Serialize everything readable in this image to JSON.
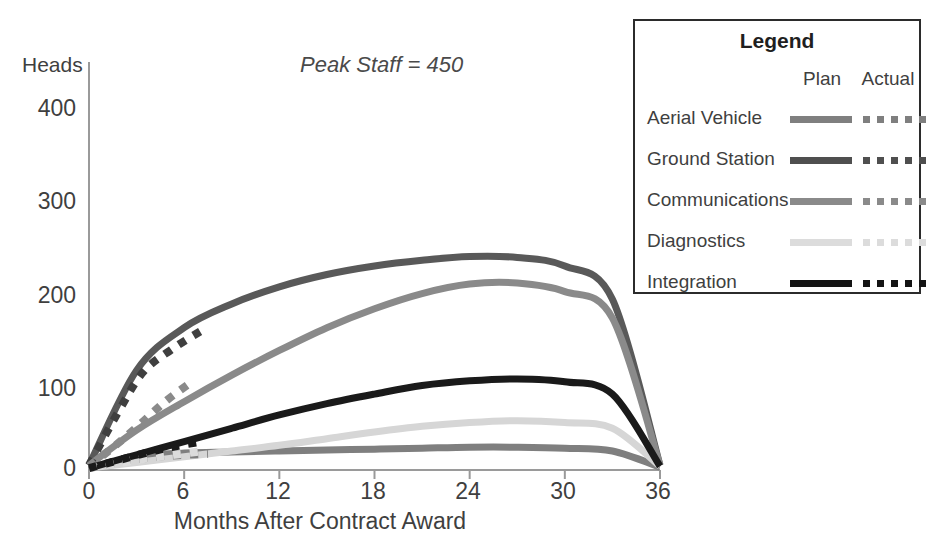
{
  "chart_data": {
    "type": "line",
    "title": "",
    "annotation": "Peak Staff = 450",
    "xlabel": "Months After Contract Award",
    "ylabel": "Heads",
    "x_ticks": [
      0,
      6,
      12,
      18,
      24,
      30,
      36
    ],
    "y_ticks": [
      0,
      100,
      200,
      300,
      400
    ],
    "xlim": [
      0,
      36
    ],
    "ylim": [
      0,
      430
    ],
    "grid": false,
    "legend_position": "top-right-box",
    "x": [
      0,
      3,
      6,
      9,
      12,
      15,
      18,
      21,
      24,
      27,
      30,
      33,
      36
    ],
    "series": [
      {
        "name": "Aerial Vehicle",
        "style": "Plan",
        "color": "#7f7f7f",
        "values": [
          2,
          14,
          18,
          19,
          20,
          21,
          22,
          23,
          24,
          24,
          23,
          20,
          3
        ]
      },
      {
        "name": "Aerial Vehicle",
        "style": "Actual",
        "color": "#7f7f7f",
        "values": [
          2,
          10,
          15,
          17
        ],
        "x": [
          0,
          2.5,
          5,
          7.5
        ]
      },
      {
        "name": "Ground Station",
        "style": "Plan",
        "color": "#595959",
        "values": [
          5,
          105,
          150,
          175,
          193,
          206,
          215,
          221,
          225,
          224,
          215,
          180,
          5
        ]
      },
      {
        "name": "Ground Station",
        "style": "Actual",
        "color": "#3f3f3f",
        "values": [
          5,
          60,
          103,
          127,
          148
        ],
        "x": [
          0,
          1.8,
          3.4,
          5.2,
          7.2
        ]
      },
      {
        "name": "Communications",
        "style": "Plan",
        "color": "#8a8a8a",
        "values": [
          5,
          42,
          72,
          100,
          126,
          150,
          170,
          186,
          196,
          197,
          188,
          160,
          5
        ]
      },
      {
        "name": "Communications",
        "style": "Actual",
        "color": "#8a8a8a",
        "values": [
          4,
          25,
          48,
          72,
          92
        ],
        "x": [
          0,
          1.6,
          3.2,
          4.8,
          6.4
        ]
      },
      {
        "name": "Diagnostics",
        "style": "Plan",
        "color": "#d6d6d6",
        "values": [
          2,
          8,
          14,
          20,
          26,
          33,
          40,
          46,
          50,
          52,
          50,
          44,
          4
        ]
      },
      {
        "name": "Diagnostics",
        "style": "Actual",
        "color": "#dcdcdc",
        "values": [
          2,
          7,
          12,
          16,
          20
        ],
        "x": [
          0,
          1.8,
          3.6,
          5.4,
          7.2
        ]
      },
      {
        "name": "Integration",
        "style": "Plan",
        "color": "#1a1a1a",
        "values": [
          2,
          16,
          30,
          44,
          58,
          70,
          80,
          89,
          94,
          96,
          93,
          80,
          4
        ]
      },
      {
        "name": "Integration",
        "style": "Actual",
        "color": "#1a1a1a",
        "values": [
          2,
          10,
          18,
          25,
          30
        ],
        "x": [
          0,
          1.8,
          3.6,
          5.4,
          7.2
        ]
      }
    ]
  },
  "axis": {
    "y_label": "Heads",
    "y_ticks": [
      "400",
      "300",
      "200",
      "100",
      "0"
    ],
    "x_ticks": [
      "0",
      "6",
      "12",
      "18",
      "24",
      "30",
      "36"
    ],
    "x_title": "Months After Contract Award"
  },
  "annotation": {
    "text": "Peak Staff = 450"
  },
  "legend": {
    "title": "Legend",
    "col_plan": "Plan",
    "col_actual": "Actual",
    "items": [
      {
        "label": "Aerial Vehicle",
        "color": "#7f7f7f"
      },
      {
        "label": "Ground Station",
        "color": "#4f4f4f"
      },
      {
        "label": "Communications",
        "color": "#8a8a8a"
      },
      {
        "label": "Diagnostics",
        "color": "#dcdcdc"
      },
      {
        "label": "Integration",
        "color": "#141414"
      }
    ]
  }
}
